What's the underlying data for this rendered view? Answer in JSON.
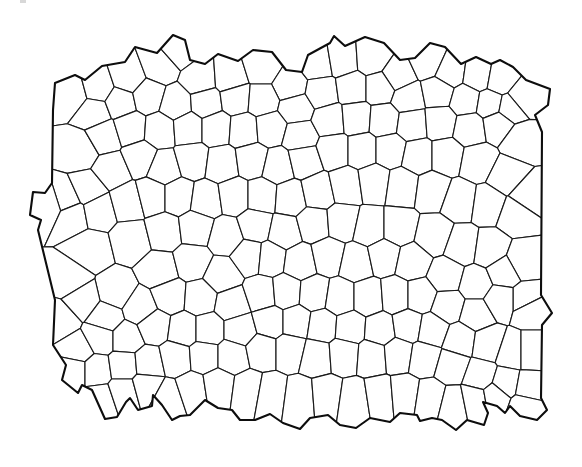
{
  "figure": {
    "kind": "cellular tessellation line drawing",
    "width": 582,
    "height": 467,
    "background": "#ffffff",
    "line_color": "#1a1a1a",
    "outline_color": "#0d0d0d",
    "outline": [
      [
        53,
        110
      ],
      [
        55,
        83
      ],
      [
        75,
        75
      ],
      [
        85,
        80
      ],
      [
        102,
        66
      ],
      [
        125,
        62
      ],
      [
        135,
        47
      ],
      [
        157,
        53
      ],
      [
        173,
        35
      ],
      [
        185,
        40
      ],
      [
        190,
        60
      ],
      [
        205,
        64
      ],
      [
        218,
        54
      ],
      [
        238,
        61
      ],
      [
        253,
        50
      ],
      [
        272,
        52
      ],
      [
        286,
        70
      ],
      [
        302,
        72
      ],
      [
        308,
        55
      ],
      [
        330,
        43
      ],
      [
        334,
        36
      ],
      [
        345,
        46
      ],
      [
        365,
        37
      ],
      [
        384,
        43
      ],
      [
        400,
        60
      ],
      [
        415,
        58
      ],
      [
        430,
        43
      ],
      [
        445,
        47
      ],
      [
        461,
        64
      ],
      [
        476,
        57
      ],
      [
        491,
        64
      ],
      [
        500,
        60
      ],
      [
        513,
        67
      ],
      [
        526,
        80
      ],
      [
        550,
        89
      ],
      [
        548,
        105
      ],
      [
        535,
        115
      ],
      [
        542,
        132
      ],
      [
        541,
        295
      ],
      [
        552,
        313
      ],
      [
        542,
        325
      ],
      [
        541,
        398
      ],
      [
        547,
        410
      ],
      [
        537,
        420
      ],
      [
        520,
        416
      ],
      [
        510,
        406
      ],
      [
        505,
        413
      ],
      [
        497,
        406
      ],
      [
        483,
        402
      ],
      [
        488,
        413
      ],
      [
        484,
        425
      ],
      [
        467,
        420
      ],
      [
        456,
        430
      ],
      [
        442,
        420
      ],
      [
        432,
        418
      ],
      [
        420,
        421
      ],
      [
        417,
        415
      ],
      [
        400,
        413
      ],
      [
        390,
        422
      ],
      [
        370,
        418
      ],
      [
        356,
        428
      ],
      [
        340,
        425
      ],
      [
        328,
        415
      ],
      [
        310,
        418
      ],
      [
        300,
        429
      ],
      [
        283,
        423
      ],
      [
        270,
        414
      ],
      [
        255,
        420
      ],
      [
        240,
        420
      ],
      [
        232,
        410
      ],
      [
        218,
        408
      ],
      [
        205,
        400
      ],
      [
        190,
        415
      ],
      [
        180,
        416
      ],
      [
        172,
        420
      ],
      [
        162,
        405
      ],
      [
        153,
        395
      ],
      [
        152,
        406
      ],
      [
        138,
        410
      ],
      [
        130,
        398
      ],
      [
        126,
        402
      ],
      [
        117,
        417
      ],
      [
        105,
        419
      ],
      [
        92,
        390
      ],
      [
        82,
        385
      ],
      [
        78,
        393
      ],
      [
        62,
        380
      ],
      [
        66,
        365
      ],
      [
        53,
        345
      ],
      [
        55,
        300
      ],
      [
        38,
        230
      ],
      [
        41,
        220
      ],
      [
        30,
        215
      ],
      [
        33,
        192
      ],
      [
        45,
        193
      ],
      [
        52,
        183
      ]
    ],
    "seeds": [
      [
        72,
        95
      ],
      [
        98,
        88
      ],
      [
        128,
        78
      ],
      [
        160,
        66
      ],
      [
        178,
        50
      ],
      [
        200,
        80
      ],
      [
        230,
        78
      ],
      [
        262,
        68
      ],
      [
        290,
        86
      ],
      [
        318,
        64
      ],
      [
        342,
        60
      ],
      [
        372,
        58
      ],
      [
        398,
        76
      ],
      [
        428,
        62
      ],
      [
        450,
        72
      ],
      [
        478,
        76
      ],
      [
        500,
        80
      ],
      [
        522,
        98
      ],
      [
        94,
        112
      ],
      [
        120,
        102
      ],
      [
        148,
        96
      ],
      [
        176,
        104
      ],
      [
        206,
        102
      ],
      [
        236,
        98
      ],
      [
        262,
        100
      ],
      [
        296,
        108
      ],
      [
        322,
        92
      ],
      [
        352,
        88
      ],
      [
        380,
        88
      ],
      [
        408,
        98
      ],
      [
        438,
        92
      ],
      [
        466,
        100
      ],
      [
        490,
        104
      ],
      [
        510,
        108
      ],
      [
        80,
        150
      ],
      [
        104,
        136
      ],
      [
        130,
        128
      ],
      [
        160,
        130
      ],
      [
        188,
        128
      ],
      [
        216,
        128
      ],
      [
        244,
        130
      ],
      [
        270,
        128
      ],
      [
        300,
        136
      ],
      [
        330,
        120
      ],
      [
        356,
        118
      ],
      [
        384,
        120
      ],
      [
        412,
        124
      ],
      [
        440,
        122
      ],
      [
        470,
        128
      ],
      [
        498,
        124
      ],
      [
        520,
        140
      ],
      [
        66,
        200
      ],
      [
        88,
        190
      ],
      [
        112,
        170
      ],
      [
        140,
        158
      ],
      [
        164,
        168
      ],
      [
        192,
        160
      ],
      [
        222,
        164
      ],
      [
        252,
        160
      ],
      [
        278,
        166
      ],
      [
        304,
        160
      ],
      [
        334,
        150
      ],
      [
        362,
        150
      ],
      [
        390,
        150
      ],
      [
        418,
        156
      ],
      [
        446,
        156
      ],
      [
        478,
        162
      ],
      [
        506,
        176
      ],
      [
        528,
        196
      ],
      [
        50,
        205
      ],
      [
        72,
        215
      ],
      [
        98,
        210
      ],
      [
        128,
        202
      ],
      [
        152,
        196
      ],
      [
        178,
        196
      ],
      [
        206,
        200
      ],
      [
        234,
        196
      ],
      [
        262,
        196
      ],
      [
        290,
        198
      ],
      [
        318,
        192
      ],
      [
        346,
        186
      ],
      [
        374,
        182
      ],
      [
        402,
        186
      ],
      [
        432,
        190
      ],
      [
        460,
        200
      ],
      [
        488,
        204
      ],
      [
        516,
        214
      ],
      [
        90,
        250
      ],
      [
        132,
        240
      ],
      [
        164,
        232
      ],
      [
        196,
        228
      ],
      [
        226,
        236
      ],
      [
        256,
        226
      ],
      [
        284,
        232
      ],
      [
        314,
        224
      ],
      [
        342,
        222
      ],
      [
        370,
        228
      ],
      [
        398,
        228
      ],
      [
        434,
        236
      ],
      [
        462,
        246
      ],
      [
        490,
        250
      ],
      [
        522,
        262
      ],
      [
        70,
        280
      ],
      [
        116,
        292
      ],
      [
        160,
        270
      ],
      [
        192,
        262
      ],
      [
        222,
        276
      ],
      [
        250,
        256
      ],
      [
        270,
        258
      ],
      [
        300,
        262
      ],
      [
        328,
        256
      ],
      [
        356,
        262
      ],
      [
        384,
        256
      ],
      [
        412,
        262
      ],
      [
        446,
        276
      ],
      [
        476,
        284
      ],
      [
        504,
        272
      ],
      [
        526,
        300
      ],
      [
        60,
        320
      ],
      [
        82,
        300
      ],
      [
        106,
        318
      ],
      [
        140,
        308
      ],
      [
        170,
        296
      ],
      [
        200,
        298
      ],
      [
        232,
        304
      ],
      [
        262,
        294
      ],
      [
        286,
        292
      ],
      [
        314,
        294
      ],
      [
        340,
        298
      ],
      [
        368,
        298
      ],
      [
        396,
        296
      ],
      [
        420,
        296
      ],
      [
        448,
        306
      ],
      [
        476,
        314
      ],
      [
        500,
        300
      ],
      [
        530,
        308
      ],
      [
        78,
        350
      ],
      [
        100,
        338
      ],
      [
        126,
        338
      ],
      [
        154,
        326
      ],
      [
        184,
        330
      ],
      [
        208,
        330
      ],
      [
        240,
        330
      ],
      [
        270,
        322
      ],
      [
        296,
        322
      ],
      [
        322,
        326
      ],
      [
        350,
        328
      ],
      [
        380,
        330
      ],
      [
        408,
        326
      ],
      [
        432,
        330
      ],
      [
        460,
        340
      ],
      [
        488,
        344
      ],
      [
        512,
        352
      ],
      [
        530,
        352
      ],
      [
        74,
        370
      ],
      [
        96,
        370
      ],
      [
        124,
        366
      ],
      [
        148,
        364
      ],
      [
        176,
        358
      ],
      [
        204,
        356
      ],
      [
        232,
        356
      ],
      [
        262,
        350
      ],
      [
        290,
        350
      ],
      [
        316,
        356
      ],
      [
        344,
        354
      ],
      [
        372,
        356
      ],
      [
        398,
        354
      ],
      [
        424,
        358
      ],
      [
        452,
        366
      ],
      [
        480,
        376
      ],
      [
        506,
        384
      ],
      [
        528,
        388
      ],
      [
        100,
        400
      ],
      [
        124,
        392
      ],
      [
        146,
        386
      ],
      [
        168,
        398
      ],
      [
        192,
        390
      ],
      [
        218,
        386
      ],
      [
        248,
        390
      ],
      [
        270,
        394
      ],
      [
        300,
        398
      ],
      [
        326,
        396
      ],
      [
        354,
        400
      ],
      [
        380,
        396
      ],
      [
        404,
        394
      ],
      [
        430,
        398
      ],
      [
        454,
        404
      ],
      [
        474,
        400
      ],
      [
        496,
        396
      ],
      [
        524,
        406
      ]
    ],
    "stray_mark": {
      "x": 20,
      "y": 0,
      "w": 6,
      "h": 3
    }
  }
}
